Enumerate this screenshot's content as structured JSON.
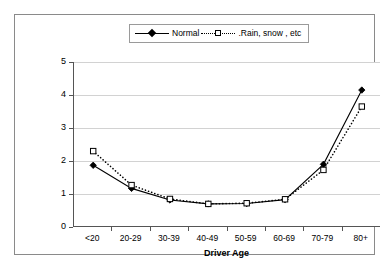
{
  "chart_data": {
    "type": "line",
    "title": "",
    "xlabel": "Driver Age",
    "ylabel": "Crash Involvement Ratio",
    "categories": [
      "<20",
      "20-29",
      "30-39",
      "40-49",
      "50-59",
      "60-69",
      "70-79",
      "80+"
    ],
    "ylim": [
      0,
      5
    ],
    "yticks": [
      "0",
      "1",
      "2",
      "3",
      "4",
      "5"
    ],
    "grid": true,
    "legend_position": "top-center",
    "series": [
      {
        "name": "Normal",
        "marker": "filled-diamond",
        "line_style": "solid",
        "color": "#000000",
        "values": [
          1.87,
          1.17,
          0.82,
          0.7,
          0.71,
          0.83,
          1.9,
          4.15
        ]
      },
      {
        "name": ".Rain, snow , etc",
        "marker": "open-square",
        "line_style": "dotted",
        "color": "#000000",
        "values": [
          2.3,
          1.27,
          0.85,
          0.7,
          0.72,
          0.84,
          1.73,
          3.65
        ]
      }
    ]
  },
  "legend": {
    "entries": [
      {
        "label": "Normal"
      },
      {
        "label": ".Rain, snow , etc"
      }
    ]
  }
}
